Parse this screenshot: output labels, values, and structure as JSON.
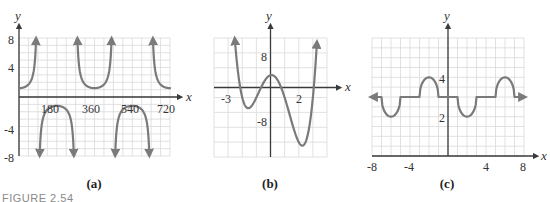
{
  "figure_caption": "FIGURE 2.54",
  "colors": {
    "curve": "#7a7a7a",
    "axis": "#3a3a3a",
    "grid": "#d9d9d9"
  },
  "chart_data": [
    {
      "id": "a",
      "type": "line",
      "subtitle": "(a)",
      "xlabel": "x",
      "ylabel": "y",
      "xlim": [
        0,
        720
      ],
      "ylim": [
        -8,
        8
      ],
      "x_ticks": [
        180,
        360,
        540,
        720
      ],
      "y_ticks": [
        8,
        4,
        -4,
        -8
      ],
      "grid": true,
      "grid_step": {
        "x": 45,
        "y": 1
      },
      "description": "Secant-like curve y ≈ 1.2·sec(x), period 360, asymptotes at 90, 270, 450, 630",
      "function": "1.2*sec(x deg)",
      "key_points": [
        {
          "x": 0,
          "y": 1.2
        },
        {
          "x": 180,
          "y": -1.2
        },
        {
          "x": 360,
          "y": 1.2
        },
        {
          "x": 540,
          "y": -1.2
        },
        {
          "x": 720,
          "y": 1.2
        }
      ],
      "asymptotes_x": [
        90,
        270,
        450,
        630
      ],
      "pixel_box": {
        "x0": 19,
        "x1": 170,
        "y0": 38,
        "y1": 156
      }
    },
    {
      "id": "b",
      "type": "line",
      "subtitle": "(b)",
      "xlabel": "x",
      "ylabel": "y",
      "xlim": [
        -4,
        4
      ],
      "ylim": [
        -16,
        16
      ],
      "x_ticks": [
        -3,
        2
      ],
      "y_ticks": [
        8,
        -8
      ],
      "grid": true,
      "grid_step": {
        "x": 1,
        "y": 4
      },
      "description": "Quartic polynomial with roots at -2, -1, 1, 3",
      "function": "(x+2)(x+1)(x-1)(x-3)",
      "key_points": [
        {
          "x": -2,
          "y": 0
        },
        {
          "x": -1.6,
          "y": -2.9
        },
        {
          "x": -1,
          "y": 0
        },
        {
          "x": 0,
          "y": 6
        },
        {
          "x": 1,
          "y": 0
        },
        {
          "x": 2.35,
          "y": -12.9
        },
        {
          "x": 3,
          "y": 0
        }
      ],
      "pixel_box": {
        "x0": 214,
        "x1": 327,
        "y0": 38,
        "y1": 157
      }
    },
    {
      "id": "c",
      "type": "line",
      "subtitle": "(c)",
      "xlabel": "x",
      "ylabel": "y",
      "xlim": [
        -8,
        8
      ],
      "ylim": [
        0,
        6
      ],
      "x_ticks": [
        -8,
        -4,
        4,
        8
      ],
      "y_ticks": [
        4,
        2
      ],
      "grid": true,
      "grid_step": {
        "x": 1,
        "y": 0.5
      },
      "description": "Piecewise curve: flat at y=3 with semicircular dips to 2 and bumps to 4",
      "segments": [
        {
          "type": "dip",
          "from": -7,
          "to": -5,
          "extreme": 2
        },
        {
          "type": "flat",
          "from": -5,
          "to": -3,
          "y": 3
        },
        {
          "type": "bump",
          "from": -3,
          "to": -1,
          "extreme": 4
        },
        {
          "type": "flat",
          "from": -1,
          "to": 1,
          "y": 3
        },
        {
          "type": "dip",
          "from": 1,
          "to": 3,
          "extreme": 2
        },
        {
          "type": "flat",
          "from": 3,
          "to": 5,
          "y": 3
        },
        {
          "type": "bump",
          "from": 5,
          "to": 7,
          "extreme": 4
        }
      ],
      "arrow_ends": {
        "left": {
          "x": -7.9,
          "y": 3
        },
        "right": {
          "x": 7.9,
          "y": 3
        }
      },
      "pixel_box": {
        "x0": 372,
        "x1": 524,
        "y0": 38,
        "y1": 156
      }
    }
  ]
}
